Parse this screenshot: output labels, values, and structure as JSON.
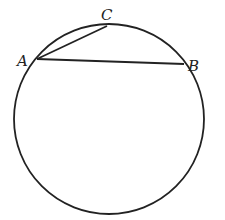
{
  "diagram": {
    "type": "circle-with-chords",
    "circle": {
      "cx": 109,
      "cy": 119,
      "r": 95
    },
    "points": [
      {
        "name": "A",
        "x": 37,
        "y": 59,
        "label_x": 17,
        "label_y": 66
      },
      {
        "name": "B",
        "x": 184,
        "y": 64,
        "label_x": 188,
        "label_y": 71
      },
      {
        "name": "C",
        "x": 107,
        "y": 26,
        "label_x": 101,
        "label_y": 20
      }
    ],
    "segments": [
      {
        "from": "A",
        "to": "B"
      },
      {
        "from": "A",
        "to": "C"
      }
    ],
    "stroke_color": "#222222"
  }
}
